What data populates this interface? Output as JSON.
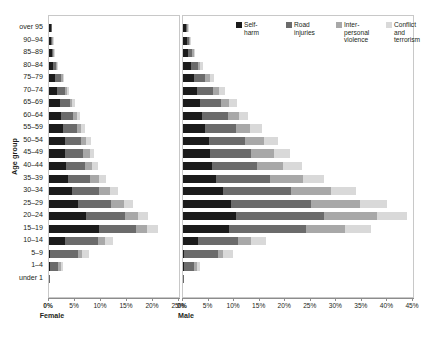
{
  "chart_data": {
    "type": "bar",
    "subtype": "population-pyramid-stacked-horizontal",
    "title": "",
    "ylabel": "Age group",
    "grid": false,
    "legend_position": "top-right",
    "panels": [
      {
        "name": "Female",
        "label": "Female",
        "xlim": [
          0,
          25
        ],
        "ticks": [
          0,
          5,
          10,
          15,
          20,
          25
        ],
        "ticklabels": [
          "0%",
          "5%",
          "10%",
          "15%",
          "20%",
          "25%"
        ]
      },
      {
        "name": "Male",
        "label": "Male",
        "xlim": [
          0,
          45
        ],
        "ticks": [
          0,
          5,
          10,
          15,
          20,
          25,
          30,
          35,
          40,
          45
        ],
        "ticklabels": [
          "0%",
          "5%",
          "10%",
          "15%",
          "20%",
          "25%",
          "30%",
          "35%",
          "40%",
          "45%"
        ]
      }
    ],
    "categories": [
      "over 95",
      "90–94",
      "85–89",
      "80–84",
      "75–79",
      "70–74",
      "65–69",
      "60–64",
      "55–59",
      "50–54",
      "45–49",
      "40–44",
      "35–39",
      "30–34",
      "25–29",
      "20–24",
      "15–19",
      "10–14",
      "5–9",
      "1–4",
      "under 1"
    ],
    "series_names": [
      "Self-harm",
      "Road injuries",
      "Interpersonal violence",
      "Conflict and terrorism"
    ],
    "series_colors": [
      "#1b1b1b",
      "#6b6b6b",
      "#a8a8a8",
      "#d9d9d9"
    ],
    "female": {
      "Self-harm": [
        0.3,
        0.4,
        0.5,
        0.8,
        1.2,
        1.6,
        2.1,
        2.4,
        2.7,
        3.0,
        3.1,
        3.2,
        3.6,
        4.4,
        5.5,
        7.2,
        9.6,
        3.1,
        0.2,
        0.1,
        0.0
      ],
      "Road injuries": [
        0.1,
        0.2,
        0.3,
        0.6,
        1.1,
        1.5,
        1.9,
        2.3,
        2.7,
        3.2,
        3.5,
        3.7,
        4.3,
        5.3,
        6.5,
        7.4,
        7.2,
        6.3,
        5.4,
        1.7,
        0.1
      ],
      "Interpersonal violence": [
        0.0,
        0.1,
        0.1,
        0.2,
        0.3,
        0.4,
        0.5,
        0.6,
        0.8,
        1.0,
        1.2,
        1.4,
        1.7,
        2.0,
        2.4,
        2.6,
        2.1,
        1.4,
        0.8,
        0.5,
        0.0
      ],
      "Conflict and terrorism": [
        0.0,
        0.1,
        0.1,
        0.2,
        0.3,
        0.4,
        0.5,
        0.6,
        0.7,
        0.8,
        0.9,
        1.1,
        1.3,
        1.5,
        1.7,
        1.9,
        2.0,
        1.6,
        1.2,
        0.4,
        0.0
      ]
    },
    "male": {
      "Self-harm": [
        0.5,
        0.7,
        1.0,
        1.5,
        2.1,
        2.7,
        3.3,
        3.8,
        4.4,
        5.0,
        5.3,
        5.6,
        6.5,
        7.9,
        9.4,
        10.3,
        9.0,
        3.0,
        0.2,
        0.1,
        0.0
      ],
      "Road injuries": [
        0.3,
        0.5,
        0.8,
        1.4,
        2.3,
        3.2,
        4.1,
        5.0,
        6.0,
        7.2,
        8.1,
        8.9,
        10.6,
        13.2,
        15.6,
        17.3,
        15.0,
        7.8,
        6.6,
        2.1,
        0.1
      ],
      "Interpersonal violence": [
        0.1,
        0.2,
        0.3,
        0.5,
        0.8,
        1.2,
        1.6,
        2.1,
        2.8,
        3.6,
        4.4,
        5.1,
        6.3,
        7.9,
        9.6,
        10.4,
        7.6,
        2.6,
        1.1,
        0.6,
        0.0
      ],
      "Conflict and terrorism": [
        0.1,
        0.2,
        0.3,
        0.5,
        0.8,
        1.1,
        1.5,
        1.9,
        2.3,
        2.8,
        3.2,
        3.6,
        4.2,
        4.9,
        5.4,
        5.8,
        5.2,
        2.9,
        1.9,
        0.6,
        0.0
      ]
    }
  },
  "legend": {
    "items": [
      {
        "label": "Self-\nharm",
        "color": "#1b1b1b"
      },
      {
        "label": "Road\ninjuries",
        "color": "#6b6b6b"
      },
      {
        "label": "Inter-\npersonal\nviolence",
        "color": "#a8a8a8"
      },
      {
        "label": "Conflict\nand\nterrorism",
        "color": "#d9d9d9"
      }
    ]
  }
}
